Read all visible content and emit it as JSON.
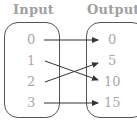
{
  "diagram": {
    "type": "mapping",
    "input_title": "Input",
    "output_title": "Output",
    "inputs": [
      "0",
      "1",
      "2",
      "3"
    ],
    "outputs": [
      "0",
      "5",
      "10",
      "15"
    ],
    "mappings": [
      {
        "from": "0",
        "to": "0"
      },
      {
        "from": "1",
        "to": "10"
      },
      {
        "from": "2",
        "to": "5"
      },
      {
        "from": "3",
        "to": "15"
      }
    ],
    "colors": {
      "text": "#a8a8a8",
      "line": "#333333",
      "border": "#555555"
    }
  }
}
